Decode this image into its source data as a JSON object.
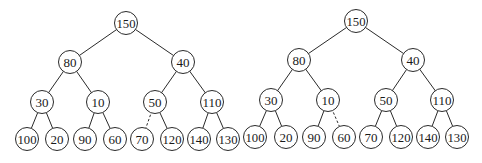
{
  "diagram": {
    "type": "binary-tree-pair",
    "node_radius": 11.5,
    "colors": {
      "stroke": "#2a2a2a",
      "fill": "#ffffff",
      "text": "#1a1a1a",
      "background": "#ffffff"
    },
    "trees": [
      {
        "name": "left-tree",
        "nodes": [
          {
            "id": "n150",
            "label": "150",
            "x": 126,
            "y": 23
          },
          {
            "id": "n80",
            "label": "80",
            "x": 70,
            "y": 62
          },
          {
            "id": "n40",
            "label": "40",
            "x": 183,
            "y": 62
          },
          {
            "id": "n30",
            "label": "30",
            "x": 42,
            "y": 102
          },
          {
            "id": "n10",
            "label": "10",
            "x": 98,
            "y": 102
          },
          {
            "id": "n50",
            "label": "50",
            "x": 155,
            "y": 102
          },
          {
            "id": "n110",
            "label": "110",
            "x": 212,
            "y": 102
          },
          {
            "id": "n100",
            "label": "100",
            "x": 27,
            "y": 139
          },
          {
            "id": "n20",
            "label": "20",
            "x": 57,
            "y": 139
          },
          {
            "id": "n90",
            "label": "90",
            "x": 85,
            "y": 139
          },
          {
            "id": "n60",
            "label": "60",
            "x": 115,
            "y": 139
          },
          {
            "id": "n70",
            "label": "70",
            "x": 142,
            "y": 139
          },
          {
            "id": "n120",
            "label": "120",
            "x": 172,
            "y": 139
          },
          {
            "id": "n140",
            "label": "140",
            "x": 199,
            "y": 139
          },
          {
            "id": "n130",
            "label": "130",
            "x": 228,
            "y": 139
          }
        ],
        "edges": [
          {
            "from": "n150",
            "to": "n80",
            "style": "solid"
          },
          {
            "from": "n150",
            "to": "n40",
            "style": "solid"
          },
          {
            "from": "n80",
            "to": "n30",
            "style": "solid"
          },
          {
            "from": "n80",
            "to": "n10",
            "style": "solid"
          },
          {
            "from": "n40",
            "to": "n50",
            "style": "solid"
          },
          {
            "from": "n40",
            "to": "n110",
            "style": "solid"
          },
          {
            "from": "n30",
            "to": "n100",
            "style": "solid"
          },
          {
            "from": "n30",
            "to": "n20",
            "style": "solid"
          },
          {
            "from": "n10",
            "to": "n90",
            "style": "solid"
          },
          {
            "from": "n10",
            "to": "n60",
            "style": "solid"
          },
          {
            "from": "n50",
            "to": "n70",
            "style": "dashed"
          },
          {
            "from": "n50",
            "to": "n120",
            "style": "solid"
          },
          {
            "from": "n110",
            "to": "n140",
            "style": "solid"
          },
          {
            "from": "n110",
            "to": "n130",
            "style": "solid"
          }
        ]
      },
      {
        "name": "right-tree",
        "nodes": [
          {
            "id": "m150",
            "label": "150",
            "x": 356,
            "y": 21
          },
          {
            "id": "m80",
            "label": "80",
            "x": 299,
            "y": 60
          },
          {
            "id": "m40",
            "label": "40",
            "x": 413,
            "y": 60
          },
          {
            "id": "m30",
            "label": "30",
            "x": 271,
            "y": 100
          },
          {
            "id": "m10",
            "label": "10",
            "x": 328,
            "y": 100
          },
          {
            "id": "m50",
            "label": "50",
            "x": 386,
            "y": 100
          },
          {
            "id": "m110",
            "label": "110",
            "x": 442,
            "y": 100
          },
          {
            "id": "m100",
            "label": "100",
            "x": 255,
            "y": 137
          },
          {
            "id": "m20",
            "label": "20",
            "x": 286,
            "y": 137
          },
          {
            "id": "m90",
            "label": "90",
            "x": 314,
            "y": 137
          },
          {
            "id": "m60",
            "label": "60",
            "x": 344,
            "y": 137
          },
          {
            "id": "m70",
            "label": "70",
            "x": 371,
            "y": 137
          },
          {
            "id": "m120",
            "label": "120",
            "x": 401,
            "y": 137
          },
          {
            "id": "m140",
            "label": "140",
            "x": 428,
            "y": 137
          },
          {
            "id": "m130",
            "label": "130",
            "x": 457,
            "y": 137
          }
        ],
        "edges": [
          {
            "from": "m150",
            "to": "m80",
            "style": "solid"
          },
          {
            "from": "m150",
            "to": "m40",
            "style": "solid"
          },
          {
            "from": "m80",
            "to": "m30",
            "style": "solid"
          },
          {
            "from": "m80",
            "to": "m10",
            "style": "solid"
          },
          {
            "from": "m40",
            "to": "m50",
            "style": "solid"
          },
          {
            "from": "m40",
            "to": "m110",
            "style": "solid"
          },
          {
            "from": "m30",
            "to": "m100",
            "style": "solid"
          },
          {
            "from": "m30",
            "to": "m20",
            "style": "solid"
          },
          {
            "from": "m10",
            "to": "m90",
            "style": "solid"
          },
          {
            "from": "m10",
            "to": "m60",
            "style": "dashed"
          },
          {
            "from": "m50",
            "to": "m70",
            "style": "solid"
          },
          {
            "from": "m50",
            "to": "m120",
            "style": "solid"
          },
          {
            "from": "m110",
            "to": "m140",
            "style": "solid"
          },
          {
            "from": "m110",
            "to": "m130",
            "style": "solid"
          }
        ]
      }
    ]
  }
}
